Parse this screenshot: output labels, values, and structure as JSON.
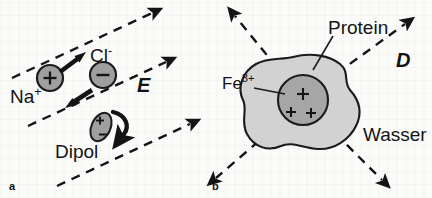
{
  "figure": {
    "caption_panels": [
      "a",
      "b"
    ],
    "colors": {
      "background": "#fbfbfa",
      "ink": "#131313",
      "ion_fill": "#9f9f9f",
      "protein_fill": "#d2d2d2",
      "core_fill": "#a6a6a6",
      "dashed_line": "#1a1a1a"
    }
  },
  "panel_a": {
    "id": "a",
    "labels": {
      "sodium": "Na",
      "sodium_charge": "+",
      "chloride": "Cl",
      "chloride_charge": "-",
      "field": "E",
      "dipole": "Dipol"
    },
    "ions": [
      {
        "name": "sodium",
        "sign": "+",
        "cx": 50,
        "cy": 78,
        "r": 13
      },
      {
        "name": "chloride",
        "sign": "−",
        "cx": 103,
        "cy": 75,
        "r": 13
      }
    ],
    "dipole": {
      "plus": "+",
      "minus": "−",
      "cx": 101,
      "cy": 127
    },
    "field_lines": 3,
    "field_direction_deg": 330
  },
  "panel_b": {
    "id": "b",
    "labels": {
      "protein": "Protein",
      "iron": "Fe",
      "iron_charge": "3+",
      "field": "D",
      "water": "Wasser"
    },
    "core_charges": [
      "+",
      "+",
      "+"
    ],
    "radial_lines": 4,
    "core": {
      "cx": 303,
      "cy": 100,
      "r": 25
    }
  }
}
